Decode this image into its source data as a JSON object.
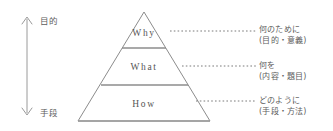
{
  "diagram": {
    "type": "pyramid",
    "title": "",
    "tier_count": 3,
    "stroke_color": "#8c8c8c",
    "text_color": "#5d5d5d",
    "axis": {
      "orientation": "vertical",
      "style": "double-headed-arrow",
      "top_label": "目的",
      "bottom_label": "手段"
    },
    "tiers": [
      {
        "level": 1,
        "position": "top",
        "label": "Why",
        "annotation_line1": "何のために",
        "annotation_line2": "(目的・意義)",
        "leader": "dotted"
      },
      {
        "level": 2,
        "position": "middle",
        "label": "What",
        "annotation_line1": "何を",
        "annotation_line2": "(内容・題目)",
        "leader": "dotted"
      },
      {
        "level": 3,
        "position": "bottom",
        "label": "How",
        "annotation_line1": "どのように",
        "annotation_line2": "(手段・方法)",
        "leader": "dotted"
      }
    ]
  }
}
